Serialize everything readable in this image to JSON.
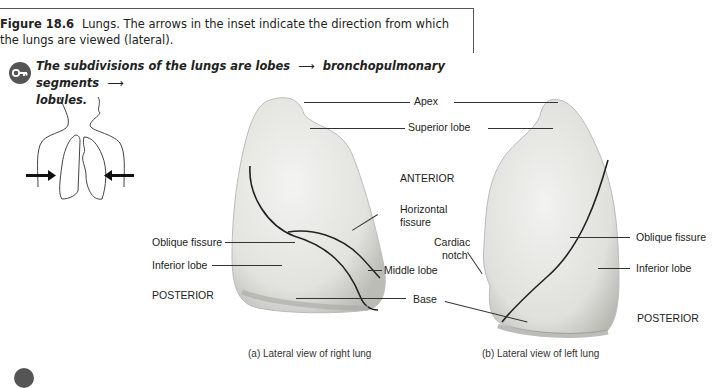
{
  "caption": {
    "figure_label": "Figure 18.6",
    "text": "Lungs. The arrows in the inset indicate the direction from which the lungs are viewed (lateral)."
  },
  "key_point": {
    "icon": "key-icon",
    "part1": "The subdivisions of the lungs are lobes",
    "arrow": "⟶",
    "part2": "bronchopulmonary segments",
    "part3": "lobules."
  },
  "inset": {
    "icon": "torso-lungs-outline",
    "arrows": [
      "arrow-right",
      "arrow-left"
    ]
  },
  "labels": {
    "apex": "Apex",
    "superior_lobe": "Superior lobe",
    "anterior": "ANTERIOR",
    "horizontal_fissure_1": "Horizontal",
    "horizontal_fissure_2": "fissure",
    "oblique_fissure_right": "Oblique fissure",
    "inferior_lobe_right": "Inferior lobe",
    "posterior_right": "POSTERIOR",
    "middle_lobe": "Middle lobe",
    "base": "Base",
    "cardiac_notch_1": "Cardiac",
    "cardiac_notch_2": "notch",
    "oblique_fissure_left": "Oblique fissure",
    "inferior_lobe_left": "Inferior lobe",
    "posterior_left": "POSTERIOR"
  },
  "subcaptions": {
    "a": "(a) Lateral view of right lung",
    "b": "(b) Lateral view of left lung"
  },
  "colors": {
    "lung_fill": "#e9e9e6",
    "lung_shade": "#bdbdb8",
    "fissure": "#2a2a2a",
    "text": "#222222"
  }
}
